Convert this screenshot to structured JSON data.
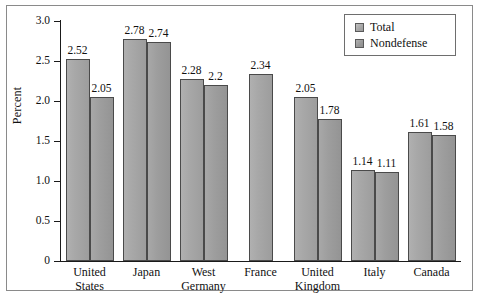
{
  "chart_data": {
    "type": "bar",
    "title": "",
    "subtitle": "",
    "xlabel": "",
    "ylabel": "Percent",
    "ylim": [
      0,
      3.0
    ],
    "ytick_labels": [
      "0",
      "0.5",
      "1.0",
      "1.5",
      "2.0",
      "2.5",
      "3.0"
    ],
    "ytick_values": [
      0,
      0.5,
      1.0,
      1.5,
      2.0,
      2.5,
      3.0
    ],
    "grid": false,
    "legend_position": "top-right",
    "categories": [
      "United States",
      "Japan",
      "West Germany",
      "France",
      "United Kingdom",
      "Italy",
      "Canada"
    ],
    "category_lines": [
      [
        "United",
        "States"
      ],
      [
        "Japan"
      ],
      [
        "West",
        "Germany"
      ],
      [
        "France"
      ],
      [
        "United",
        "Kingdom"
      ],
      [
        "Italy"
      ],
      [
        "Canada"
      ]
    ],
    "series": [
      {
        "name": "Total",
        "values": [
          2.52,
          2.78,
          2.28,
          2.34,
          2.05,
          1.14,
          1.61
        ],
        "labels": [
          "2.52",
          "2.78",
          "2.28",
          "2.34",
          "2.05",
          "1.14",
          "1.61"
        ]
      },
      {
        "name": "Nondefense",
        "values": [
          2.05,
          2.74,
          2.2,
          null,
          1.78,
          1.11,
          1.58
        ],
        "labels": [
          "2.05",
          "2.74",
          "2.2",
          "",
          "1.78",
          "1.11",
          "1.58"
        ]
      }
    ]
  },
  "legend": {
    "items": [
      {
        "label": "Total",
        "swatch": "legend-swatch-total"
      },
      {
        "label": "Nondefense",
        "swatch": "legend-swatch-nondefense"
      }
    ]
  },
  "colors": {
    "bar_total": "#a8a8a8",
    "bar_nondefense": "#9e9e9e",
    "bar_border": "#4a4a4a",
    "axis": "#1a1a1a",
    "frame": "#8a8a8a",
    "text": "#111111",
    "background": "#ffffff"
  }
}
